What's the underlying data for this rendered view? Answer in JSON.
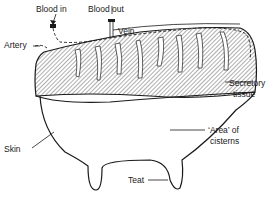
{
  "diagram": {
    "type": "anatomical cross-section",
    "labels": {
      "blood_in": "Blood in",
      "blood_out": "Blood out",
      "artery": "Artery",
      "vein": "Vein",
      "secretory_line1": "Secretory",
      "secretory_line2": "tissue",
      "skin": "Skin",
      "cisterns_line1": "‘Area’ of",
      "cisterns_line2": "cisterns",
      "teat": "Teat"
    },
    "colors": {
      "ink": "#1a1a1a",
      "background": "#ffffff"
    }
  }
}
